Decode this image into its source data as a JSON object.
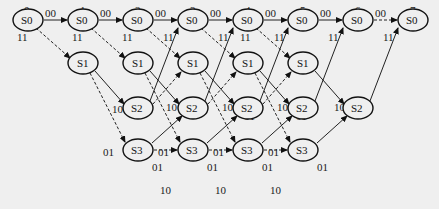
{
  "diagram": {
    "type": "trellis",
    "time_steps": [
      "0",
      "1",
      "2",
      "3",
      "4",
      "5",
      "6",
      "7"
    ],
    "states": [
      "S0",
      "S1",
      "S2",
      "S3"
    ],
    "nodes": [
      {
        "id": "n0_0",
        "t": 0,
        "state": "S0",
        "x": 28,
        "y": 47
      },
      {
        "id": "n1_0",
        "t": 1,
        "state": "S0",
        "x": 83,
        "y": 47
      },
      {
        "id": "n2_0",
        "t": 2,
        "state": "S0",
        "x": 138,
        "y": 47
      },
      {
        "id": "n3_0",
        "t": 3,
        "state": "S0",
        "x": 193,
        "y": 47
      },
      {
        "id": "n4_0",
        "t": 4,
        "state": "S0",
        "x": 248,
        "y": 47
      },
      {
        "id": "n5_0",
        "t": 5,
        "state": "S0",
        "x": 303,
        "y": 47
      },
      {
        "id": "n6_0",
        "t": 6,
        "state": "S0",
        "x": 358,
        "y": 47
      },
      {
        "id": "n7_0",
        "t": 7,
        "state": "S0",
        "x": 413,
        "y": 47
      },
      {
        "id": "n1_1",
        "t": 1,
        "state": "S1",
        "x": 83,
        "y": 90
      },
      {
        "id": "n2_1",
        "t": 2,
        "state": "S1",
        "x": 138,
        "y": 90
      },
      {
        "id": "n3_1",
        "t": 3,
        "state": "S1",
        "x": 193,
        "y": 90
      },
      {
        "id": "n4_1",
        "t": 4,
        "state": "S1",
        "x": 248,
        "y": 90
      },
      {
        "id": "n5_1",
        "t": 5,
        "state": "S1",
        "x": 303,
        "y": 90
      },
      {
        "id": "n2_2",
        "t": 2,
        "state": "S2",
        "x": 138,
        "y": 133
      },
      {
        "id": "n3_2",
        "t": 3,
        "state": "S2",
        "x": 193,
        "y": 133
      },
      {
        "id": "n4_2",
        "t": 4,
        "state": "S2",
        "x": 248,
        "y": 133
      },
      {
        "id": "n5_2",
        "t": 5,
        "state": "S2",
        "x": 303,
        "y": 133
      },
      {
        "id": "n6_2",
        "t": 6,
        "state": "S2",
        "x": 358,
        "y": 133
      },
      {
        "id": "n2_3",
        "t": 2,
        "state": "S3",
        "x": 138,
        "y": 180
      },
      {
        "id": "n3_3",
        "t": 3,
        "state": "S3",
        "x": 193,
        "y": 180
      },
      {
        "id": "n4_3",
        "t": 4,
        "state": "S3",
        "x": 248,
        "y": 180
      },
      {
        "id": "n5_3",
        "t": 5,
        "state": "S3",
        "x": 303,
        "y": 180
      }
    ],
    "edges": [
      {
        "from": "S0@0",
        "to": "S0@1",
        "label": "00",
        "style": "solid"
      },
      {
        "from": "S0@1",
        "to": "S0@2",
        "label": "00",
        "style": "solid"
      },
      {
        "from": "S0@2",
        "to": "S0@3",
        "label": "00",
        "style": "solid"
      },
      {
        "from": "S0@3",
        "to": "S0@4",
        "label": "00",
        "style": "solid"
      },
      {
        "from": "S0@4",
        "to": "S0@5",
        "label": "00",
        "style": "solid"
      },
      {
        "from": "S0@5",
        "to": "S0@6",
        "label": "00",
        "style": "solid"
      },
      {
        "from": "S0@6",
        "to": "S0@7",
        "label": "00",
        "style": "dashed"
      },
      {
        "from": "S0@0",
        "to": "S1@1",
        "label": "11",
        "style": "dashed"
      },
      {
        "from": "S0@1",
        "to": "S1@2",
        "label": "11",
        "style": "dashed"
      },
      {
        "from": "S0@2",
        "to": "S1@3",
        "label": "11",
        "style": "dashed"
      },
      {
        "from": "S0@3",
        "to": "S1@4",
        "label": "11",
        "style": "dashed"
      },
      {
        "from": "S0@4",
        "to": "S1@5",
        "label": "11",
        "style": "dashed"
      },
      {
        "from": "S2@2",
        "to": "S0@3",
        "label": "11",
        "style": "solid"
      },
      {
        "from": "S2@3",
        "to": "S0@4",
        "label": "11",
        "style": "solid"
      },
      {
        "from": "S2@4",
        "to": "S0@5",
        "label": "11",
        "style": "solid"
      },
      {
        "from": "S2@5",
        "to": "S0@6",
        "label": "11",
        "style": "solid"
      },
      {
        "from": "S2@6",
        "to": "S0@7",
        "label": "11",
        "style": "solid"
      },
      {
        "from": "S1@1",
        "to": "S2@2",
        "label": "10",
        "style": "solid"
      },
      {
        "from": "S1@2",
        "to": "S2@3",
        "label": "10",
        "style": "solid"
      },
      {
        "from": "S1@3",
        "to": "S2@4",
        "label": "10",
        "style": "solid"
      },
      {
        "from": "S1@4",
        "to": "S2@5",
        "label": "10",
        "style": "solid"
      },
      {
        "from": "S1@5",
        "to": "S2@6",
        "label": "10",
        "style": "solid"
      },
      {
        "from": "S1@1",
        "to": "S3@2",
        "label": "01",
        "style": "dashed"
      },
      {
        "from": "S1@2",
        "to": "S3@3",
        "label": "01",
        "style": "dashed"
      },
      {
        "from": "S1@3",
        "to": "S3@4",
        "label": "01",
        "style": "dashed"
      },
      {
        "from": "S1@4",
        "to": "S3@5",
        "label": "01",
        "style": "dashed"
      },
      {
        "from": "S2@2",
        "to": "S1@3",
        "label": "01",
        "style": "dashed"
      },
      {
        "from": "S2@3",
        "to": "S1@4",
        "label": "01",
        "style": "dashed"
      },
      {
        "from": "S2@4",
        "to": "S1@5",
        "label": "01",
        "style": "dashed"
      },
      {
        "from": "S3@2",
        "to": "S2@3",
        "label": "01",
        "style": "solid"
      },
      {
        "from": "S3@3",
        "to": "S2@4",
        "label": "01",
        "style": "solid"
      },
      {
        "from": "S3@4",
        "to": "S2@5",
        "label": "01",
        "style": "solid"
      },
      {
        "from": "S3@5",
        "to": "S2@6",
        "label": "01",
        "style": "solid"
      },
      {
        "from": "S3@2",
        "to": "S3@3",
        "label": "10",
        "style": "dashed"
      },
      {
        "from": "S3@3",
        "to": "S3@4",
        "label": "10",
        "style": "dashed"
      },
      {
        "from": "S3@4",
        "to": "S3@5",
        "label": "10",
        "style": "dashed"
      }
    ],
    "labels": {
      "t0": "0",
      "t1": "1",
      "t2": "2",
      "t3": "3",
      "t4": "4",
      "t5": "5",
      "t6": "6",
      "t7": "7",
      "s0": "S0",
      "s1": "S1",
      "s2": "S2",
      "s3": "S3",
      "l00": "00",
      "l11": "11",
      "l10": "10",
      "l01": "01"
    }
  }
}
